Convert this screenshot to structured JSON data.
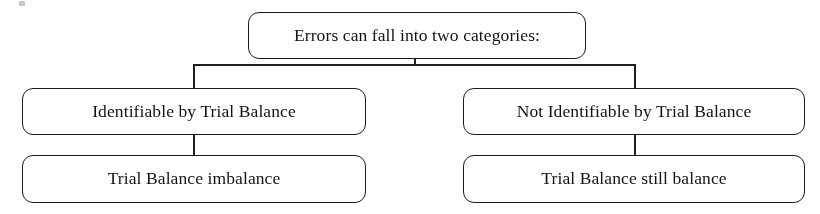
{
  "diagram": {
    "title": "Errors can fall into two categories",
    "type": "hierarchical-flowchart",
    "background_color": "#ffffff",
    "line_color": "#1f1f1f",
    "text_color": "#131313",
    "root": {
      "id": "root",
      "label": "Errors can fall into two categories:"
    },
    "branches": [
      {
        "id": "identifiable",
        "label": "Identifiable by Trial Balance",
        "child": {
          "id": "imbalance",
          "label": "Trial Balance imbalance"
        }
      },
      {
        "id": "not-identifiable",
        "label": "Not Identifiable by Trial Balance",
        "child": {
          "id": "still-balance",
          "label": "Trial Balance still balance"
        }
      }
    ]
  }
}
